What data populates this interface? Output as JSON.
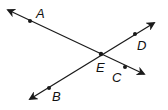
{
  "diagram": {
    "stroke_color": "#1a1a1a",
    "points": [
      {
        "name": "A",
        "x": 30,
        "y": 21,
        "label_x": 36,
        "label_y": 18
      },
      {
        "name": "B",
        "x": 49,
        "y": 88,
        "label_x": 52,
        "label_y": 101
      },
      {
        "name": "C",
        "x": 125,
        "y": 67,
        "label_x": 112,
        "label_y": 82
      },
      {
        "name": "D",
        "x": 135,
        "y": 34,
        "label_x": 137,
        "label_y": 50
      },
      {
        "name": "E",
        "x": 101,
        "y": 54,
        "label_x": 96,
        "label_y": 72
      }
    ],
    "lines": [
      {
        "name": "line-AC",
        "x1": 8,
        "y1": 10,
        "x2": 144,
        "y2": 74
      },
      {
        "name": "line-BD",
        "x1": 30,
        "y1": 99,
        "x2": 154,
        "y2": 23
      }
    ],
    "labels": {
      "A": "A",
      "B": "B",
      "C": "C",
      "D": "D",
      "E": "E"
    }
  }
}
